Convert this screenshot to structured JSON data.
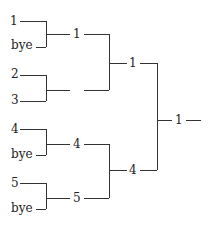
{
  "bracket": {
    "round1": [
      {
        "top": "1",
        "bottom": "bye"
      },
      {
        "top": "2",
        "bottom": "3"
      },
      {
        "top": "4",
        "bottom": "bye"
      },
      {
        "top": "5",
        "bottom": "bye"
      }
    ],
    "round2": [
      "1",
      "",
      "4",
      "5"
    ],
    "round3": [
      "1",
      "4"
    ],
    "winner": "1"
  }
}
